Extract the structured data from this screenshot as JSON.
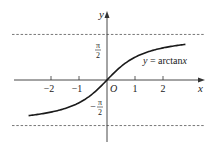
{
  "chart_data": {
    "type": "line",
    "title": "",
    "function_label": "y = arctanx",
    "xlabel": "x",
    "ylabel": "y",
    "origin_label": "O",
    "x_ticks": [
      -2,
      -1,
      1,
      2
    ],
    "x_tick_labels": [
      "−2",
      "−1",
      "1",
      "2"
    ],
    "y_ticks": [
      {
        "value": 1.5708,
        "label_num": "π",
        "label_den": "2",
        "sign": ""
      },
      {
        "value": -1.5708,
        "label_num": "π",
        "label_den": "2",
        "sign": "−"
      }
    ],
    "asymptotes": [
      1.5708,
      -1.5708
    ],
    "xlim": [
      -2.8,
      2.8
    ],
    "ylim": [
      -1.5708,
      1.5708
    ],
    "series": [
      {
        "name": "y = arctanx",
        "x": [
          -2.8,
          -2.4,
          -2.0,
          -1.6,
          -1.2,
          -0.8,
          -0.4,
          0,
          0.4,
          0.8,
          1.2,
          1.6,
          2.0,
          2.4,
          2.8
        ],
        "y": [
          -1.228,
          -1.176,
          -1.107,
          -1.012,
          -0.876,
          -0.675,
          -0.381,
          0,
          0.381,
          0.675,
          0.876,
          1.012,
          1.107,
          1.176,
          1.228
        ]
      }
    ],
    "grid": false,
    "legend": "none"
  },
  "colors": {
    "axis": "#333333",
    "curve": "#1a1a1a",
    "dashed": "#555555"
  }
}
